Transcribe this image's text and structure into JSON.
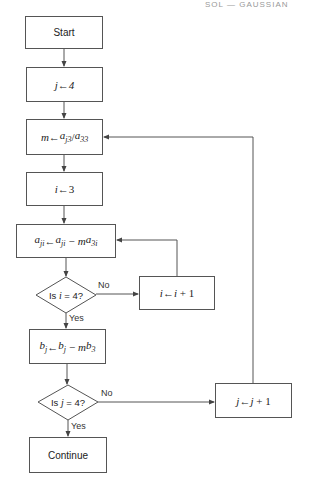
{
  "header": {
    "text": "SOL — GAUSSIAN"
  },
  "flowchart": {
    "start": {
      "label": "Start"
    },
    "init_j": {
      "var": "j",
      "arrow": "←",
      "value": "4"
    },
    "compute_m": {
      "lhs": "m",
      "arrow": "←",
      "num_base": "a",
      "num_sub": "j3",
      "slash": "/",
      "den_base": "a",
      "den_sub": "33"
    },
    "init_i": {
      "var": "i",
      "arrow": "←",
      "value": "3"
    },
    "update_a": {
      "lhs_base": "a",
      "lhs_sub": "ji",
      "arrow": "←",
      "rhs_base": "a",
      "rhs_sub": "ji",
      "minus": "−",
      "m": "m",
      "term_base": "a",
      "term_sub": "3i"
    },
    "decision_i": {
      "prefix": "Is ",
      "var": "i",
      "rest": " = 4?",
      "no_label": "No",
      "yes_label": "Yes"
    },
    "inc_i": {
      "var": "i",
      "arrow": "←",
      "expr_var": "i",
      "expr_rest": " + 1"
    },
    "update_b": {
      "lhs_base": "b",
      "lhs_sub": "j",
      "arrow": "←",
      "rhs_base": "b",
      "rhs_sub": "j",
      "minus": "−",
      "m": "m",
      "term_base": "b",
      "term_sub": "3"
    },
    "decision_j": {
      "prefix": "Is ",
      "var": "j",
      "rest": " = 4?",
      "no_label": "No",
      "yes_label": "Yes"
    },
    "inc_j": {
      "var": "j",
      "arrow": "←",
      "expr_var": "j",
      "expr_rest": " + 1"
    },
    "end": {
      "label": "Continue"
    }
  },
  "colors": {
    "line": "#555555",
    "text": "#222222",
    "background": "#ffffff"
  }
}
